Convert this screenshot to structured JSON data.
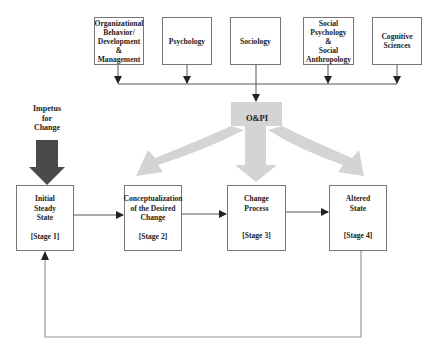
{
  "disciplines": [
    {
      "label": "Organizational Behavior/ Development & Management",
      "lines": [
        "Organizational",
        "Behavior/",
        "Development",
        "&",
        "Management"
      ]
    },
    {
      "label": "Psychology",
      "lines": [
        "Psychology"
      ]
    },
    {
      "label": "Sociology",
      "lines": [
        "Sociology"
      ]
    },
    {
      "label": "Social Psychology & Social Anthropology",
      "lines": [
        "Social",
        "Psychology",
        "&",
        "Social",
        "Anthropology"
      ]
    },
    {
      "label": "Cognitive Sciences",
      "lines": [
        "Cognitive",
        "Sciences"
      ]
    }
  ],
  "hub": {
    "label": "O&PI"
  },
  "impetus": {
    "lines": [
      "Impetus",
      "for",
      "Change"
    ]
  },
  "stages": [
    {
      "lines": [
        "Initial",
        "Steady",
        "State"
      ],
      "tag": "[Stage 1]"
    },
    {
      "lines": [
        "Conceptualization",
        "of the Desired",
        "Change"
      ],
      "tag": "[Stage 2]"
    },
    {
      "lines": [
        "Change",
        "Process"
      ],
      "tag": "[Stage 3]"
    },
    {
      "lines": [
        "Altered",
        "State"
      ],
      "tag": "[Stage 4]"
    }
  ],
  "colors": {
    "line": "#555555",
    "fan_arrow": "#d4d4d4",
    "impetus_arrow": "#4a4a4a",
    "feedback_line": "#aaaaaa"
  }
}
